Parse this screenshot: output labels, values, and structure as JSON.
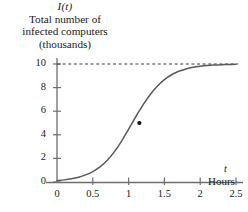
{
  "chart_data": {
    "type": "line",
    "title": "Total number of infected computers (thousands)",
    "title_lines": [
      "Total number of",
      "infected computers",
      "(thousands)"
    ],
    "title_variable": "I(t)",
    "xlabel": "Hours",
    "xlabel_variable": "t",
    "ylabel": "",
    "ylabel_variable": "I(t)",
    "xlim": [
      0,
      2.6
    ],
    "ylim": [
      0,
      10.6
    ],
    "xticks": [
      "0",
      "0.5",
      "1",
      "1.5",
      "2",
      "2.5"
    ],
    "xtick_values": [
      0,
      0.5,
      1,
      1.5,
      2,
      2.5
    ],
    "yticks": [
      "0",
      "2",
      "4",
      "6",
      "8",
      "10"
    ],
    "ytick_values": [
      0,
      2,
      4,
      6,
      8,
      10
    ],
    "grid": false,
    "legend": null,
    "curve_name": "logistic growth of infected computers",
    "asymptote": {
      "value": 10,
      "style": "dashed",
      "label": "10"
    },
    "marked_point": {
      "x": 1.15,
      "y": 5,
      "label": ""
    },
    "series": [
      {
        "name": "I(t)",
        "x": [
          0,
          0.1,
          0.2,
          0.3,
          0.4,
          0.5,
          0.6,
          0.7,
          0.8,
          0.9,
          1.0,
          1.1,
          1.15,
          1.2,
          1.3,
          1.4,
          1.5,
          1.6,
          1.7,
          1.8,
          1.9,
          2.0,
          2.1,
          2.2,
          2.3,
          2.4,
          2.5
        ],
        "y": [
          0.12,
          0.18,
          0.27,
          0.4,
          0.6,
          0.88,
          1.28,
          1.83,
          2.55,
          3.45,
          4.48,
          5.53,
          6.03,
          6.52,
          7.4,
          8.12,
          8.68,
          9.09,
          9.38,
          9.58,
          9.72,
          9.81,
          9.87,
          9.91,
          9.94,
          9.96,
          9.97
        ]
      }
    ],
    "colors": {
      "curve": "#5a5a5a",
      "axis": "#6e6e6e",
      "asymptote": "#3a3a3a",
      "point": "#111111",
      "text": "#1a1a1a",
      "background": "#ffffff"
    }
  }
}
